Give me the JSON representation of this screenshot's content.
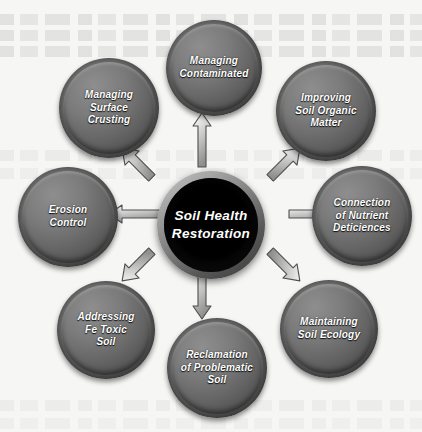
{
  "diagram": {
    "type": "hub-and-spoke",
    "center": {
      "id": "soil-health-restoration",
      "lines": [
        "Soil Health",
        "Restoration"
      ],
      "text": "Soil Health Restoration",
      "fill_color": "#000000",
      "text_color": "#ffffff"
    },
    "node_fill_color": "#6b6b6b",
    "node_text_color": "#ffffff",
    "arrow_fill_color": "#d9d9d9",
    "arrow_stroke_color": "#4f4f4f",
    "background_color": "#f6f6f4",
    "nodes": [
      {
        "id": "managing-contaminated",
        "position": "top",
        "direction": "up",
        "lines": [
          "Managing",
          "Contaminated"
        ]
      },
      {
        "id": "improving-soil-organic-matter",
        "position": "top-right",
        "direction": "up-right",
        "lines": [
          "Improving",
          "Soil Organic",
          "Matter"
        ]
      },
      {
        "id": "connection-of-nutrient-deficiences",
        "position": "right",
        "direction": "right",
        "lines": [
          "Connection",
          "of  Nutrient",
          "Deticiences"
        ]
      },
      {
        "id": "maintaining-soil-ecology",
        "position": "bottom-right",
        "direction": "down-right",
        "lines": [
          "Maintaining",
          "Soil Ecology"
        ]
      },
      {
        "id": "reclamation-of-problematic-soil",
        "position": "bottom",
        "direction": "down",
        "lines": [
          "Reclamation",
          "of  Problematic",
          "Soil"
        ]
      },
      {
        "id": "addressing-fe-toxic-soil",
        "position": "bottom-left",
        "direction": "down-left",
        "lines": [
          "Addressing",
          "Fe Toxic",
          "Soil"
        ]
      },
      {
        "id": "erosion-control",
        "position": "left",
        "direction": "left",
        "lines": [
          "Erosion",
          "Control"
        ]
      },
      {
        "id": "managing-surface-crusting",
        "position": "top-left",
        "direction": "up-left",
        "lines": [
          "Managing",
          "Surface",
          "Crusting"
        ]
      }
    ]
  }
}
